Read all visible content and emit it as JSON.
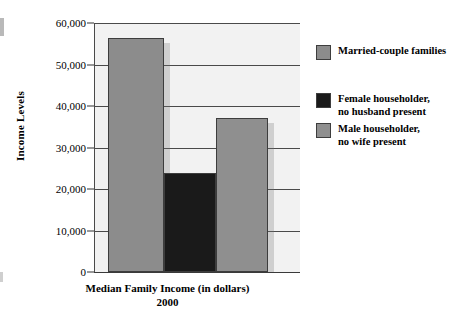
{
  "chart_data": {
    "type": "bar",
    "title": "",
    "subtitle": "",
    "xlabel": "Median Family Income (in dollars)",
    "xlabel_line2": "2000",
    "ylabel": "Income Levels",
    "ylim": [
      0,
      60000
    ],
    "ytick_values": [
      60000,
      50000,
      40000,
      30000,
      20000,
      10000,
      0
    ],
    "ytick_labels": [
      "60,000",
      "50,000",
      "40,000",
      "30,000",
      "20,000",
      "10,000",
      "0"
    ],
    "grid": true,
    "legend_position": "right",
    "categories": [
      "Married-couple families",
      "Female householder, no husband present",
      "Male householder, no wife present"
    ],
    "values": [
      56500,
      23800,
      37000
    ],
    "bars": [
      {
        "label": "Married-couple families",
        "value": 56500,
        "color": "#8c8c8c"
      },
      {
        "label": "Female householder, no husband present",
        "value": 23800,
        "color": "#1a1a1a"
      },
      {
        "label": "Male householder, no wife present",
        "value": 37000,
        "color": "#8f8f8f"
      }
    ]
  },
  "axis": {
    "y_title": "Income Levels",
    "ticks": [
      {
        "label": "60,000"
      },
      {
        "label": "50,000"
      },
      {
        "label": "40,000"
      },
      {
        "label": "30,000"
      },
      {
        "label": "20,000"
      },
      {
        "label": "10,000"
      },
      {
        "label": "0"
      }
    ],
    "x_caption_line1": "Median Family Income (in dollars)",
    "x_caption_line2": "2000"
  },
  "legend": {
    "items": [
      {
        "line1": "Married-couple families",
        "line2": "",
        "color": "#8c8c8c"
      },
      {
        "line1": "Female householder,",
        "line2": "no husband present",
        "color": "#1a1a1a"
      },
      {
        "line1": "Male householder,",
        "line2": "no wife present",
        "color": "#8f8f8f"
      }
    ]
  },
  "colors": {
    "gray_bar": "#8c8c8c",
    "black_bar": "#1a1a1a",
    "plot_background": "#f2f2f2",
    "gridline": "#4a4a4a",
    "page_background": "#ffffff"
  }
}
